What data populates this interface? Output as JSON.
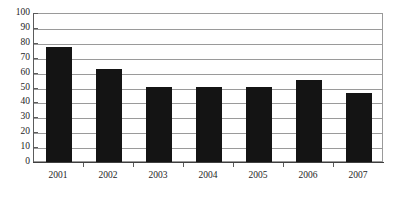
{
  "chart_data": {
    "type": "bar",
    "title": "",
    "xlabel": "",
    "ylabel": "",
    "categories": [
      "2001",
      "2002",
      "2003",
      "2004",
      "2005",
      "2006",
      "2007"
    ],
    "values": [
      78,
      63,
      51,
      51,
      51,
      56,
      47
    ],
    "ylim": [
      0,
      100
    ],
    "y_ticks": [
      0,
      10,
      20,
      30,
      40,
      50,
      60,
      70,
      80,
      90,
      100
    ],
    "y_tick_labels": [
      "0",
      "10",
      "20",
      "30",
      "40",
      "50",
      "60",
      "70",
      "80",
      "90",
      "100"
    ],
    "grid": true,
    "grid_orientation": "horizontal",
    "legend": false,
    "legend_position": "none",
    "series": [
      {
        "name": "",
        "values": [
          78,
          63,
          51,
          51,
          51,
          56,
          47
        ]
      }
    ],
    "colors": {
      "bar": "#141414",
      "gridline": "#9a9a9a",
      "axis": "#5b5b5b",
      "background": "#ffffff",
      "text": "#1d1d1d"
    }
  }
}
